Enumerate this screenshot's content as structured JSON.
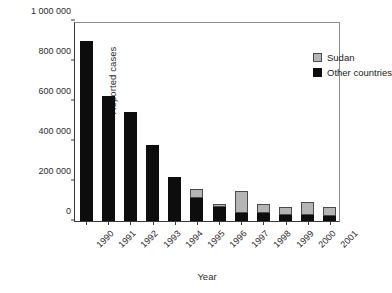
{
  "chart_data": {
    "type": "bar",
    "subtype": "stacked-vertical",
    "title": "",
    "xlabel": "Year",
    "ylabel": "Reported cases",
    "categories": [
      "1990",
      "1991",
      "1992",
      "1993",
      "1994",
      "1995",
      "1996",
      "1997",
      "1998",
      "1999",
      "2000",
      "2001"
    ],
    "series": [
      {
        "name": "Other countries",
        "color": "#0d0d0d",
        "values": [
          900000,
          625000,
          545000,
          380000,
          220000,
          115000,
          70000,
          42000,
          42000,
          32000,
          32000,
          27000
        ]
      },
      {
        "name": "Sudan",
        "color": "#b5b5b5",
        "values": [
          0,
          0,
          0,
          0,
          0,
          45000,
          15000,
          110000,
          42000,
          40000,
          62000,
          45000
        ]
      }
    ],
    "totals": [
      900000,
      625000,
      545000,
      380000,
      220000,
      160000,
      85000,
      152000,
      84000,
      72000,
      94000,
      72000
    ],
    "ylim": [
      0,
      1000000
    ],
    "ytick_values": [
      0,
      200000,
      400000,
      600000,
      800000,
      1000000
    ],
    "ytick_labels": [
      "0",
      "200 000",
      "400 000",
      "600 000",
      "800 000",
      "1 000 000"
    ],
    "grid": false,
    "legend_position": "top-right",
    "legend_entries": [
      "Sudan",
      "Other countries"
    ]
  },
  "axes": {
    "y_title": "Reported cases",
    "x_title": "Year"
  },
  "legend": {
    "items": [
      {
        "label": "Sudan",
        "swatch": "gray-swatch-icon"
      },
      {
        "label": "Other countries",
        "swatch": "black-swatch-icon"
      }
    ]
  },
  "colors": {
    "sudan": "#b5b5b5",
    "other_countries": "#0d0d0d",
    "axis": "#3a3a3a",
    "background": "#ffffff"
  }
}
